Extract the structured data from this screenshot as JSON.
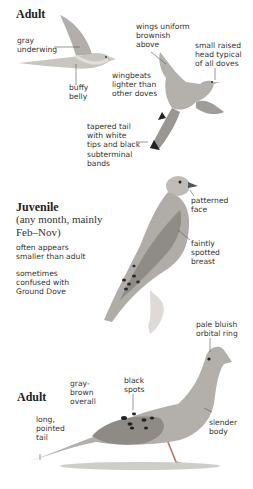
{
  "sections": [
    {
      "heading": "Adult",
      "labels": {
        "gray_underwing": "gray\nunderwing",
        "buffy_belly": "buffy\nbelly",
        "wings_uniform": "wings uniform\nbrownish\nabove",
        "small_raised_head": "small raised\nhead typical\nof all doves",
        "wingbeats": "wingbeats\nlighter than\nother doves",
        "tapered_tail": "tapered tail\nwith white\ntips and black\nsubterminal\nbands"
      }
    },
    {
      "heading": "Juvenile",
      "subheading": "(any month, mainly\nFeb–Nov)",
      "notes": [
        "often appears\nsmaller than adult",
        "sometimes\nconfused with\nGround Dove"
      ],
      "labels": {
        "patterned_face": "patterned\nface",
        "faintly_spotted_breast": "faintly\nspotted\nbreast"
      }
    },
    {
      "heading": "Adult",
      "labels": {
        "pale_bluish_orbital_ring": "pale bluish\norbital ring",
        "gray_brown_overall": "gray-\nbrown\noverall",
        "black_spots": "black\nspots",
        "long_pointed_tail": "long,\npointed\ntail",
        "slender_body": "slender\nbody"
      }
    }
  ],
  "colors": {
    "text": "#2a2a2a",
    "bird_gray": "#a9a7a4",
    "bird_light": "#d6d3cf",
    "bird_dark": "#555350",
    "spots": "#222222",
    "ground": "#cfcdca",
    "leader": "#444444"
  }
}
